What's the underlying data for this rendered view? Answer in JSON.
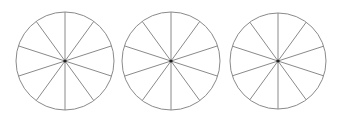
{
  "diagram": {
    "stroke_color": "#8a8a8a",
    "center_color": "#222222",
    "background": "#ffffff",
    "circles": [
      {
        "id": "circle-1",
        "cx": 65,
        "cy": 61,
        "r": 49,
        "sectors": 10
      },
      {
        "id": "circle-2",
        "cx": 171,
        "cy": 61,
        "r": 49,
        "sectors": 10
      },
      {
        "id": "circle-3",
        "cx": 278,
        "cy": 61,
        "r": 48,
        "sectors": 10
      }
    ]
  }
}
